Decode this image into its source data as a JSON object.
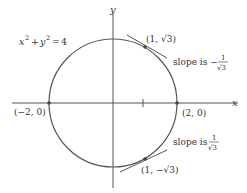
{
  "diagram": {
    "equation": {
      "lhs_x": "x",
      "lhs_y": "y",
      "rhs": "4"
    },
    "axes": {
      "x_label": "x",
      "y_label": "y"
    },
    "points": {
      "top": "(1, √3)",
      "bottom": "(1, −√3)",
      "left": "(−2, 0)",
      "right": "(2, 0)"
    },
    "annotations": {
      "slope_top_prefix": "slope is −",
      "slope_bottom_prefix": "slope is ",
      "frac_num": "1",
      "frac_den": "√3"
    },
    "colors": {
      "curve": "#555555",
      "axes": "#555555",
      "text": "#333333"
    }
  }
}
